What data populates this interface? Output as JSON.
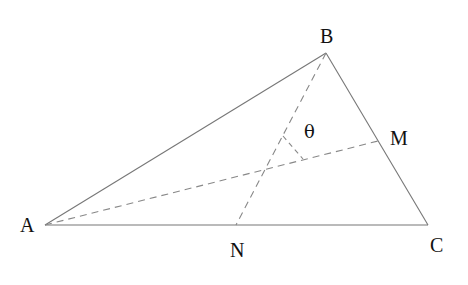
{
  "diagram": {
    "title": "",
    "type": "triangle with medians",
    "points": {
      "A": {
        "label": "A",
        "x": 45,
        "y": 225
      },
      "B": {
        "label": "B",
        "x": 326,
        "y": 53
      },
      "C": {
        "label": "C",
        "x": 428,
        "y": 225
      },
      "M": {
        "label": "M",
        "x": 378,
        "y": 141
      },
      "N": {
        "label": "N",
        "x": 236,
        "y": 225
      }
    },
    "angle_label": "θ",
    "segments": [
      {
        "from": "A",
        "to": "B",
        "style": "solid"
      },
      {
        "from": "B",
        "to": "C",
        "style": "solid"
      },
      {
        "from": "A",
        "to": "C",
        "style": "solid"
      },
      {
        "from": "A",
        "to": "M",
        "style": "dashed"
      },
      {
        "from": "B",
        "to": "N",
        "style": "dashed"
      }
    ],
    "colors": {
      "line": "#777777",
      "text": "#111111",
      "background": "#ffffff"
    }
  }
}
